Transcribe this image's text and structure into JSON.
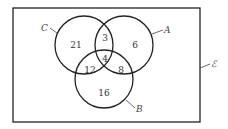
{
  "diagram": {
    "type": "venn-3-set",
    "universal_set": {
      "label": "ℰ"
    },
    "sets": [
      {
        "id": "C",
        "label": "C"
      },
      {
        "id": "A",
        "label": "A"
      },
      {
        "id": "B",
        "label": "B"
      }
    ],
    "regions": {
      "C_only": "21",
      "A_and_C_only": "3",
      "A_only": "6",
      "A_B_C": "4",
      "B_and_C_only": "12",
      "A_and_B_only": "8",
      "B_only": "16"
    },
    "colors": {
      "stroke": "#222222",
      "text": "#333333",
      "background": "#ffffff"
    }
  }
}
